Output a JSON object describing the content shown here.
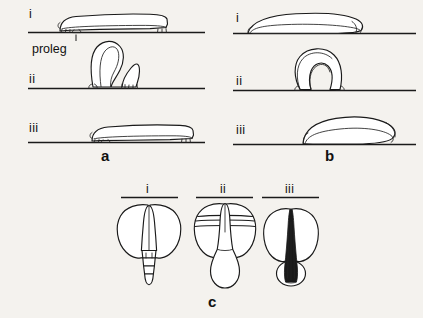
{
  "figure": {
    "background_color": "#f4f2ee",
    "ink_color": "#1a1a1a",
    "width": 423,
    "height": 318,
    "caption_letters": {
      "a": "a",
      "b": "b",
      "c": "c"
    }
  },
  "panel_a": {
    "letter": "a",
    "subject": "looper caterpillar locomotion sequence",
    "steps": [
      {
        "numeral": "i",
        "description": "body extended flat on substrate"
      },
      {
        "numeral": "ii",
        "description": "body arched into a loop, prolegs drawn forward"
      },
      {
        "numeral": "iii",
        "description": "body extended forward again in new position"
      }
    ],
    "callout": {
      "label": "proleg",
      "target": "abdominal proleg of caterpillar"
    }
  },
  "panel_b": {
    "letter": "b",
    "subject": "legless larva (maggot) locomotion sequence",
    "steps": [
      {
        "numeral": "i",
        "description": "body elongated and flattened on substrate"
      },
      {
        "numeral": "ii",
        "description": "body contracted into a raised arch"
      },
      {
        "numeral": "iii",
        "description": "body extended forward in new position"
      }
    ]
  },
  "panel_c": {
    "letter": "c",
    "subject": "dorsal views of insect abdomen and wing forms",
    "figures": [
      {
        "numeral": "i",
        "description": "tapering segmented abdomen projecting beyond wings"
      },
      {
        "numeral": "ii",
        "description": "banded wings with broad club-shaped abdomen"
      },
      {
        "numeral": "iii",
        "description": "narrow dark elongate ovipositor with rounded basal swelling"
      }
    ]
  }
}
